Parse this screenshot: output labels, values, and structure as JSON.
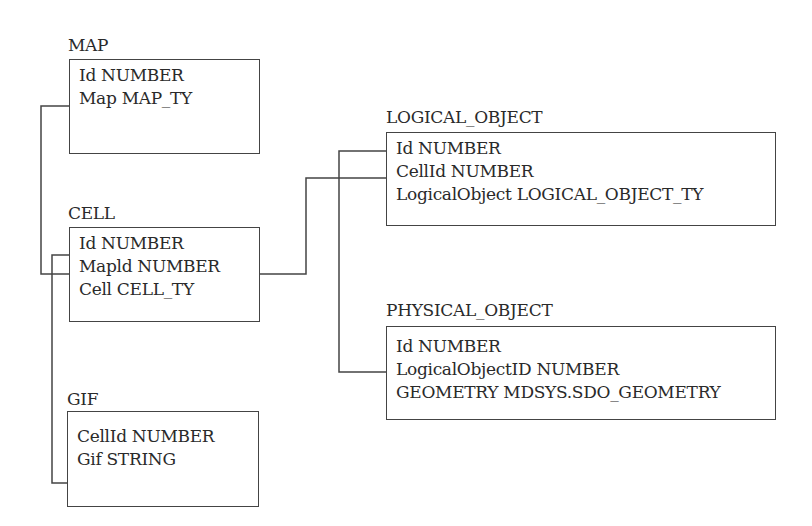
{
  "diagram": {
    "type": "entity-relationship",
    "tables": [
      {
        "name": "MAP",
        "columns": [
          "Id NUMBER",
          "Map MAP_TY"
        ]
      },
      {
        "name": "CELL",
        "columns": [
          "Id NUMBER",
          "Mapld NUMBER",
          "Cell CELL_TY"
        ]
      },
      {
        "name": "GIF",
        "columns": [
          "CellId NUMBER",
          "Gif STRING"
        ]
      },
      {
        "name": "LOGICAL_OBJECT",
        "columns": [
          "Id NUMBER",
          "CellId NUMBER",
          "LogicalObject LOGICAL_OBJECT_TY"
        ]
      },
      {
        "name": "PHYSICAL_OBJECT",
        "columns": [
          "Id NUMBER",
          "LogicalObjectID NUMBER",
          "GEOMETRY MDSYS.SDO_GEOMETRY"
        ]
      }
    ],
    "relationships": [
      {
        "from": "MAP.Id",
        "to": "CELL.Mapld"
      },
      {
        "from": "CELL.Id",
        "to": "GIF.CellId"
      },
      {
        "from": "CELL.Id",
        "to": "LOGICAL_OBJECT.CellId"
      },
      {
        "from": "LOGICAL_OBJECT.Id",
        "to": "PHYSICAL_OBJECT.LogicalObjectID"
      }
    ],
    "line_color": "#444444"
  }
}
